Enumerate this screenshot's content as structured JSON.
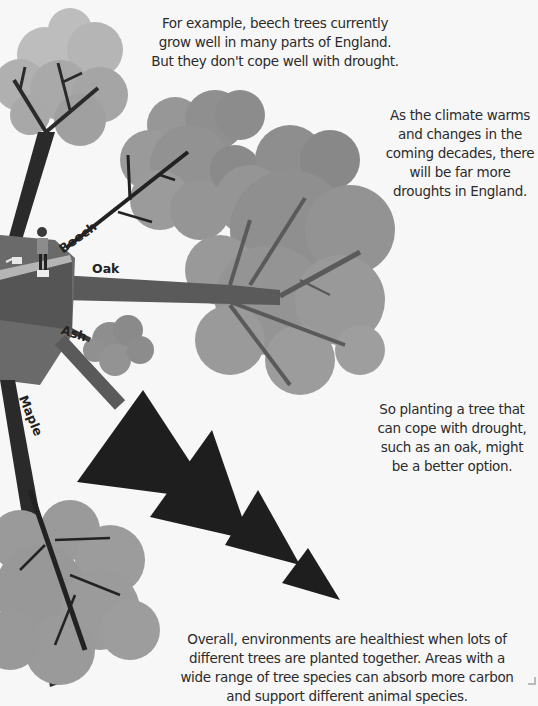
{
  "texts": {
    "intro": "For example, beech trees currently grow well in many parts of England. But they don't cope well with drought.",
    "climate": "As the climate warms and changes in the coming decades, there will be far more droughts in England.",
    "oak_option": "So planting a tree that can cope with drought, such as an oak, might be a better option.",
    "overall": "Overall, environments are healthiest when lots of different trees are planted together. Areas with a wide range of tree species can absorb more carbon and support different animal species."
  },
  "tree_labels": {
    "beech": "Beech",
    "oak": "Oak",
    "ash": "Ash",
    "maple": "Maple"
  },
  "colors": {
    "background": "#f7f7f7",
    "canopy_light": "#a8a8a8",
    "canopy_mid": "#8c8c8c",
    "trunk_dark": "#2a2a2a",
    "trunk_mid": "#5a5a5a",
    "triangles": "#1e1e1e",
    "text": "#2b2b2b"
  }
}
